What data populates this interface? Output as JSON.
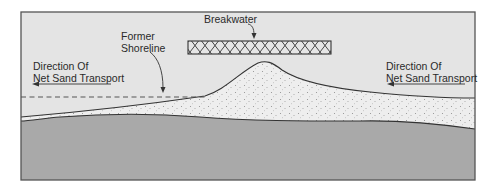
{
  "diagram": {
    "colors": {
      "water": "#e4e4e4",
      "sand": "#ededed",
      "sand_dots": "#9a9a9a",
      "seabed": "#a9a9a9",
      "line": "#333333",
      "frame": "#555555"
    },
    "labels": {
      "breakwater": "Breakwater",
      "former_shoreline_line1": "Former",
      "former_shoreline_line2": "Shoreline",
      "left_transport_line1": "Direction Of",
      "left_transport_line2": "Net Sand Transport",
      "right_transport_line1": "Direction Of",
      "right_transport_line2": "Net Sand Transport"
    },
    "arrows": {
      "left": "left-pointing arrow under left label",
      "right": "left-pointing arrow under right label"
    }
  }
}
